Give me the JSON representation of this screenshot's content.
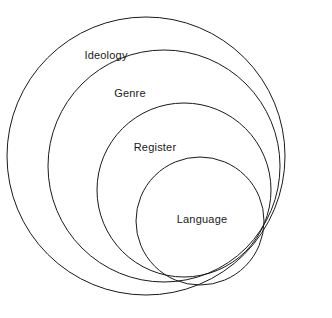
{
  "diagram": {
    "type": "nested-circles",
    "background_color": "#ffffff",
    "stroke_color": "#1a1a1a",
    "stroke_width": 1,
    "label_color": "#1a1a1a",
    "tangent_point": {
      "x": 263,
      "y": 272
    },
    "rings": [
      {
        "label": "Ideology",
        "level": 1,
        "cx": 146,
        "cy": 156,
        "r": 139,
        "label_x": 106,
        "label_y": 55
      },
      {
        "label": "Genre",
        "level": 2,
        "cx": 164,
        "cy": 166,
        "r": 116,
        "label_x": 130,
        "label_y": 93
      },
      {
        "label": "Register",
        "level": 3,
        "cx": 184,
        "cy": 190,
        "r": 87,
        "label_x": 155,
        "label_y": 147
      },
      {
        "label": "Language",
        "level": 4,
        "cx": 200,
        "cy": 221,
        "r": 64,
        "label_x": 202,
        "label_y": 219
      }
    ]
  }
}
